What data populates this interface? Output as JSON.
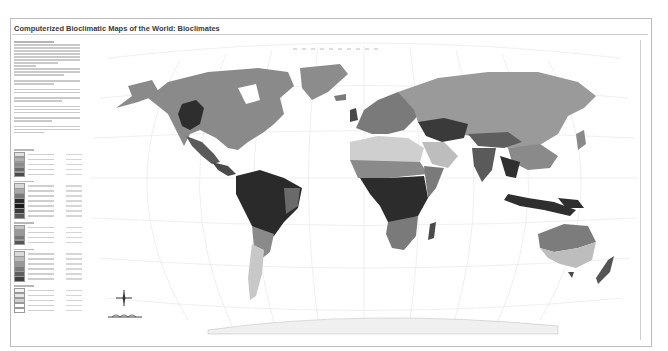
{
  "header": {
    "title": "Computerized Bioclimatic Maps of the World: Bioclimates"
  },
  "legend": {
    "swatch_groups": [
      {
        "swatches": [
          "#e0e0e0",
          "#b0b0b0",
          "#8c8c8c",
          "#6a6a6a",
          "#4a4a4a"
        ]
      },
      {
        "swatches": [
          "#d8d8d8",
          "#a8a8a8",
          "#7a7a7a",
          "#2a2a2a",
          "#1a1a1a",
          "#3c3c3c",
          "#5a5a5a"
        ]
      },
      {
        "swatches": [
          "#c4c4c4",
          "#9a9a9a",
          "#777777",
          "#555555"
        ]
      },
      {
        "swatches": [
          "#dadada",
          "#bbbbbb",
          "#999999",
          "#7b7b7b",
          "#606060",
          "#404040"
        ]
      },
      {
        "swatches": [
          "#f2f2f2",
          "#e6e6e6",
          "#d0d0d0",
          "#ffffff",
          "#ffffff"
        ]
      }
    ]
  },
  "map": {
    "projection_style": "world-robinson-like",
    "regions": [
      {
        "name": "north-america",
        "shade": "#8a8a8a"
      },
      {
        "name": "rocky-mountains",
        "shade": "#2e2e2e"
      },
      {
        "name": "central-america",
        "shade": "#505050"
      },
      {
        "name": "south-america-amazon",
        "shade": "#2a2a2a"
      },
      {
        "name": "patagonia",
        "shade": "#c8c8c8"
      },
      {
        "name": "greenland",
        "shade": "#8c8c8c"
      },
      {
        "name": "europe",
        "shade": "#7a7a7a"
      },
      {
        "name": "northern-asia",
        "shade": "#9a9a9a"
      },
      {
        "name": "central-asia",
        "shade": "#3a3a3a"
      },
      {
        "name": "sahara",
        "shade": "#cfcfcf"
      },
      {
        "name": "sahel",
        "shade": "#8a8a8a"
      },
      {
        "name": "central-africa",
        "shade": "#2c2c2c"
      },
      {
        "name": "southern-africa",
        "shade": "#7a7a7a"
      },
      {
        "name": "arabia",
        "shade": "#bdbdbd"
      },
      {
        "name": "india",
        "shade": "#5a5a5a"
      },
      {
        "name": "southeast-asia",
        "shade": "#2f2f2f"
      },
      {
        "name": "australia-interior",
        "shade": "#7c7c7c"
      },
      {
        "name": "australia-south",
        "shade": "#bdbdbd"
      },
      {
        "name": "new-zealand",
        "shade": "#555555"
      },
      {
        "name": "antarctica",
        "shade": "#f0f0f0"
      }
    ]
  },
  "colors": {
    "land_dark": "#2a2a2a",
    "land_mid": "#8a8a8a",
    "land_light": "#cfcfcf",
    "graticule": "#e2e2e2",
    "frame": "#bdbdbd"
  }
}
